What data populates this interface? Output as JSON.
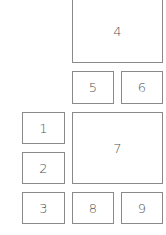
{
  "diagram": {
    "boxes": [
      {
        "id": "1",
        "label": "1",
        "x": 22,
        "y": 112,
        "w": 43,
        "h": 32
      },
      {
        "id": "2",
        "label": "2",
        "x": 22,
        "y": 152,
        "w": 43,
        "h": 32
      },
      {
        "id": "3",
        "label": "3",
        "x": 22,
        "y": 192,
        "w": 43,
        "h": 32
      },
      {
        "id": "4",
        "label": "4",
        "x": 72,
        "y": 0,
        "w": 91,
        "h": 63
      },
      {
        "id": "5",
        "label": "5",
        "x": 72,
        "y": 71,
        "w": 42,
        "h": 33
      },
      {
        "id": "6",
        "label": "6",
        "x": 121,
        "y": 71,
        "w": 42,
        "h": 33
      },
      {
        "id": "7",
        "label": "7",
        "x": 72,
        "y": 112,
        "w": 91,
        "h": 72
      },
      {
        "id": "8",
        "label": "8",
        "x": 72,
        "y": 192,
        "w": 42,
        "h": 32
      },
      {
        "id": "9",
        "label": "9",
        "x": 121,
        "y": 192,
        "w": 42,
        "h": 32
      }
    ]
  }
}
